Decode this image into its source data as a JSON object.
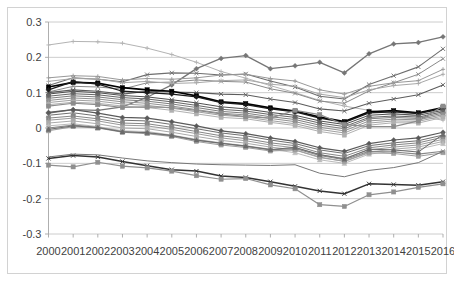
{
  "chart_data": {
    "type": "line",
    "title": "",
    "subtitle": "",
    "xlabel": "",
    "ylabel": "",
    "grid": true,
    "legend": "none",
    "ylim": [
      -0.3,
      0.3
    ],
    "ytick_labels": [
      "0.3",
      "0.2",
      "0.1",
      "0",
      "-0.1",
      "-0.2",
      "-0.3"
    ],
    "ytick_values": [
      0.3,
      0.2,
      0.1,
      0,
      -0.1,
      -0.2,
      -0.3
    ],
    "categories": [
      "2000",
      "2001",
      "2002",
      "2003",
      "2004",
      "2005",
      "2006",
      "2007",
      "2008",
      "2009",
      "2010",
      "2011",
      "2012",
      "2013",
      "2014",
      "2015",
      "2016"
    ],
    "x": [
      2000,
      2001,
      2002,
      2003,
      2004,
      2005,
      2006,
      2007,
      2008,
      2009,
      2010,
      2011,
      2012,
      2013,
      2014,
      2015,
      2016
    ],
    "series": [
      {
        "name": "Series 1",
        "color": "#b3b3b3",
        "marker": "plus",
        "width": 1.0,
        "values": [
          0.235,
          0.245,
          0.244,
          0.24,
          0.226,
          0.208,
          0.186,
          0.16,
          0.141,
          0.12,
          0.1,
          0.078,
          0.062,
          0.05,
          0.04,
          0.034,
          0.022
        ]
      },
      {
        "name": "Series 2",
        "color": "#767676",
        "marker": "diamond",
        "width": 1.3,
        "values": [
          0.042,
          0.052,
          0.05,
          0.06,
          0.087,
          0.122,
          0.168,
          0.197,
          0.205,
          0.168,
          0.176,
          0.186,
          0.156,
          0.21,
          0.238,
          0.242,
          0.258
        ]
      },
      {
        "name": "Series 3",
        "color": "#6e6e6e",
        "marker": "x",
        "width": 1.1,
        "values": [
          0.12,
          0.142,
          0.138,
          0.131,
          0.151,
          0.156,
          0.155,
          0.15,
          0.153,
          0.133,
          0.116,
          0.09,
          0.082,
          0.123,
          0.148,
          0.173,
          0.224
        ]
      },
      {
        "name": "Series 4",
        "color": "#8a8a8a",
        "marker": "x",
        "width": 1.0,
        "values": [
          0.102,
          0.118,
          0.116,
          0.11,
          0.128,
          0.13,
          0.136,
          0.132,
          0.13,
          0.111,
          0.098,
          0.076,
          0.07,
          0.105,
          0.128,
          0.152,
          0.196
        ]
      },
      {
        "name": "Series 5",
        "color": "#999999",
        "marker": "plus",
        "width": 1.0,
        "values": [
          0.142,
          0.148,
          0.146,
          0.136,
          0.14,
          0.138,
          0.142,
          0.15,
          0.152,
          0.14,
          0.133,
          0.108,
          0.096,
          0.118,
          0.128,
          0.134,
          0.166
        ]
      },
      {
        "name": "Series 6",
        "color": "#a8a8a8",
        "marker": "plus",
        "width": 1.0,
        "values": [
          0.132,
          0.14,
          0.139,
          0.128,
          0.132,
          0.126,
          0.128,
          0.134,
          0.136,
          0.124,
          0.118,
          0.096,
          0.086,
          0.108,
          0.12,
          0.126,
          0.152
        ]
      },
      {
        "name": "Series 7",
        "color": "#5c5c5c",
        "marker": "x",
        "width": 1.1,
        "values": [
          0.1,
          0.108,
          0.104,
          0.096,
          0.104,
          0.102,
          0.1,
          0.096,
          0.094,
          0.082,
          0.072,
          0.054,
          0.048,
          0.07,
          0.082,
          0.094,
          0.122
        ]
      },
      {
        "name": "Series 8",
        "color": "#000000",
        "marker": "square",
        "width": 1.7,
        "values": [
          0.116,
          0.129,
          0.127,
          0.114,
          0.108,
          0.104,
          0.091,
          0.074,
          0.069,
          0.057,
          0.048,
          0.031,
          0.018,
          0.046,
          0.049,
          0.043,
          0.058
        ]
      },
      {
        "name": "Series 9",
        "color": "#1a1a1a",
        "marker": "diamond",
        "width": 1.3,
        "values": [
          0.108,
          0.131,
          0.124,
          0.104,
          0.1,
          0.096,
          0.088,
          0.072,
          0.066,
          0.054,
          0.046,
          0.028,
          0.016,
          0.043,
          0.046,
          0.041,
          0.055
        ]
      },
      {
        "name": "Series 10",
        "color": "#4d4d4d",
        "marker": "x",
        "width": 1.0,
        "values": [
          0.096,
          0.104,
          0.1,
          0.092,
          0.088,
          0.08,
          0.071,
          0.06,
          0.054,
          0.044,
          0.036,
          0.02,
          0.01,
          0.036,
          0.04,
          0.036,
          0.05
        ]
      },
      {
        "name": "Series 11",
        "color": "#656565",
        "marker": "square",
        "width": 1.0,
        "values": [
          0.09,
          0.097,
          0.094,
          0.086,
          0.082,
          0.074,
          0.064,
          0.053,
          0.048,
          0.038,
          0.03,
          0.014,
          0.004,
          0.03,
          0.034,
          0.031,
          0.046
        ]
      },
      {
        "name": "Series 12",
        "color": "#7d7d7d",
        "marker": "x",
        "width": 1.0,
        "values": [
          0.084,
          0.091,
          0.088,
          0.08,
          0.076,
          0.068,
          0.058,
          0.047,
          0.042,
          0.032,
          0.024,
          0.008,
          -0.002,
          0.026,
          0.03,
          0.027,
          0.042
        ]
      },
      {
        "name": "Series 13",
        "color": "#909090",
        "marker": "square",
        "width": 1.0,
        "values": [
          0.078,
          0.085,
          0.082,
          0.074,
          0.07,
          0.062,
          0.052,
          0.042,
          0.037,
          0.027,
          0.018,
          0.002,
          -0.008,
          0.02,
          0.025,
          0.023,
          0.038
        ]
      },
      {
        "name": "Series 14",
        "color": "#a0a0a0",
        "marker": "plus",
        "width": 1.0,
        "values": [
          0.072,
          0.079,
          0.076,
          0.068,
          0.064,
          0.056,
          0.046,
          0.036,
          0.031,
          0.021,
          0.012,
          -0.004,
          -0.014,
          0.014,
          0.02,
          0.019,
          0.034
        ]
      },
      {
        "name": "Series 15",
        "color": "#b0b0b0",
        "marker": "square",
        "width": 1.0,
        "values": [
          0.066,
          0.073,
          0.07,
          0.062,
          0.058,
          0.05,
          0.04,
          0.03,
          0.026,
          0.016,
          0.007,
          -0.01,
          -0.02,
          0.008,
          0.015,
          0.014,
          0.03
        ]
      },
      {
        "name": "Series 16",
        "color": "#8c8c8c",
        "marker": "square",
        "width": 1.2,
        "values": [
          0.062,
          0.07,
          0.066,
          0.058,
          0.06,
          0.058,
          0.05,
          0.04,
          0.032,
          0.028,
          0.05,
          0.038,
          0.01,
          0.004,
          0.004,
          0.02,
          0.062
        ]
      },
      {
        "name": "Series 17",
        "color": "#5a5a5a",
        "marker": "diamond",
        "width": 1.2,
        "values": [
          0.044,
          0.052,
          0.042,
          0.03,
          0.028,
          0.018,
          0.006,
          -0.008,
          -0.016,
          -0.028,
          -0.038,
          -0.056,
          -0.066,
          -0.044,
          -0.034,
          -0.028,
          -0.012
        ]
      },
      {
        "name": "Series 18",
        "color": "#707070",
        "marker": "x",
        "width": 1.0,
        "values": [
          0.036,
          0.043,
          0.034,
          0.022,
          0.02,
          0.01,
          -0.002,
          -0.014,
          -0.022,
          -0.034,
          -0.044,
          -0.062,
          -0.072,
          -0.05,
          -0.042,
          -0.036,
          -0.02
        ]
      },
      {
        "name": "Series 19",
        "color": "#868686",
        "marker": "square",
        "width": 1.0,
        "values": [
          0.028,
          0.034,
          0.026,
          0.014,
          0.012,
          0.002,
          -0.01,
          -0.022,
          -0.03,
          -0.042,
          -0.05,
          -0.07,
          -0.08,
          -0.056,
          -0.048,
          -0.042,
          -0.026
        ]
      },
      {
        "name": "Series 20",
        "color": "#9a9a9a",
        "marker": "plus",
        "width": 1.0,
        "values": [
          0.022,
          0.028,
          0.02,
          0.008,
          0.006,
          -0.004,
          -0.016,
          -0.028,
          -0.036,
          -0.048,
          -0.056,
          -0.076,
          -0.086,
          -0.062,
          -0.054,
          -0.048,
          -0.032
        ]
      },
      {
        "name": "Series 21",
        "color": "#aaaaaa",
        "marker": "square",
        "width": 1.0,
        "values": [
          0.014,
          0.02,
          0.012,
          0.0,
          -0.002,
          -0.012,
          -0.024,
          -0.035,
          -0.043,
          -0.054,
          -0.062,
          -0.084,
          -0.094,
          -0.068,
          -0.06,
          -0.054,
          -0.038
        ]
      },
      {
        "name": "Series 22",
        "color": "#bbbbbb",
        "marker": "triangle",
        "width": 1.0,
        "values": [
          0.006,
          0.012,
          0.004,
          -0.008,
          -0.01,
          -0.02,
          -0.032,
          -0.042,
          -0.05,
          -0.06,
          -0.07,
          -0.09,
          -0.1,
          -0.074,
          -0.066,
          -0.06,
          -0.044
        ]
      },
      {
        "name": "Series 23",
        "color": "#9e9e9e",
        "marker": "square",
        "width": 1.1,
        "values": [
          -0.008,
          0.004,
          0.0,
          -0.012,
          -0.016,
          -0.024,
          -0.038,
          -0.048,
          -0.055,
          -0.065,
          -0.062,
          -0.082,
          -0.095,
          -0.07,
          -0.072,
          -0.08,
          -0.07
        ]
      },
      {
        "name": "Series 24",
        "color": "#878787",
        "marker": "x",
        "width": 1.1,
        "values": [
          0.0,
          0.008,
          0.002,
          -0.01,
          -0.014,
          -0.022,
          -0.035,
          -0.044,
          -0.052,
          -0.062,
          -0.058,
          -0.078,
          -0.09,
          -0.066,
          -0.068,
          -0.074,
          -0.066
        ]
      },
      {
        "name": "Series 25",
        "color": "#6b6b6b",
        "marker": "triangle",
        "width": 1.0,
        "values": [
          -0.004,
          0.006,
          0.001,
          -0.011,
          -0.013,
          -0.021,
          -0.034,
          -0.043,
          -0.051,
          -0.061,
          -0.055,
          -0.075,
          -0.088,
          -0.06,
          -0.062,
          -0.068,
          -0.018
        ]
      },
      {
        "name": "Series 26",
        "color": "#333333",
        "marker": "x",
        "width": 1.5,
        "values": [
          -0.086,
          -0.078,
          -0.082,
          -0.095,
          -0.107,
          -0.118,
          -0.122,
          -0.136,
          -0.14,
          -0.152,
          -0.165,
          -0.178,
          -0.186,
          -0.158,
          -0.16,
          -0.162,
          -0.152
        ]
      },
      {
        "name": "Series 27",
        "color": "#8f8f8f",
        "marker": "square",
        "width": 1.2,
        "values": [
          -0.105,
          -0.11,
          -0.097,
          -0.108,
          -0.113,
          -0.122,
          -0.135,
          -0.145,
          -0.143,
          -0.161,
          -0.172,
          -0.217,
          -0.222,
          -0.189,
          -0.181,
          -0.168,
          -0.158
        ]
      },
      {
        "name": "Series 28",
        "color": "#777777",
        "marker": "none",
        "width": 1.0,
        "values": [
          -0.082,
          -0.074,
          -0.076,
          -0.085,
          -0.093,
          -0.098,
          -0.102,
          -0.104,
          -0.105,
          -0.106,
          -0.104,
          -0.128,
          -0.138,
          -0.12,
          -0.112,
          -0.098,
          -0.066
        ]
      }
    ]
  },
  "axes": {
    "y_axis_name": "value-axis",
    "x_axis_name": "year-axis"
  }
}
